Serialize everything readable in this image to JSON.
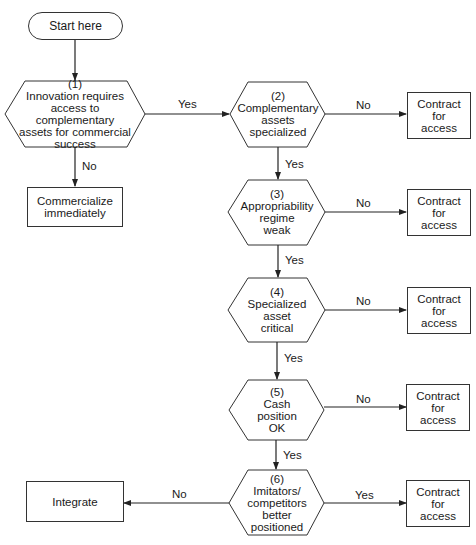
{
  "start": {
    "label": "Start here"
  },
  "decisions": [
    {
      "id": "1",
      "number": "(1)",
      "text": "Innovation requires\naccess to complementary\nassets for commercial\nsuccess"
    },
    {
      "id": "2",
      "number": "(2)",
      "text": "Complementary\nassets\nspecialized"
    },
    {
      "id": "3",
      "number": "(3)",
      "text": "Appropriability\nregime\nweak"
    },
    {
      "id": "4",
      "number": "(4)",
      "text": "Specialized\nasset\ncritical"
    },
    {
      "id": "5",
      "number": "(5)",
      "text": "Cash\nposition\nOK"
    },
    {
      "id": "6",
      "number": "(6)",
      "text": "Imitators/\ncompetitors\nbetter\npositioned"
    }
  ],
  "outcomes": {
    "commercialize": "Commercialize\nimmediately",
    "integrate": "Integrate",
    "contract": [
      "Contract\nfor\naccess",
      "Contract\nfor\naccess",
      "Contract\nfor\naccess",
      "Contract\nfor\naccess",
      "Contract\nfor\naccess"
    ]
  },
  "edges": {
    "d1_yes": "Yes",
    "d1_no": "No",
    "d2_no": "No",
    "d2_yes": "Yes",
    "d3_no": "No",
    "d3_yes": "Yes",
    "d4_no": "No",
    "d4_yes": "Yes",
    "d5_no": "No",
    "d5_yes": "Yes",
    "d6_no": "No",
    "d6_yes": "Yes"
  }
}
